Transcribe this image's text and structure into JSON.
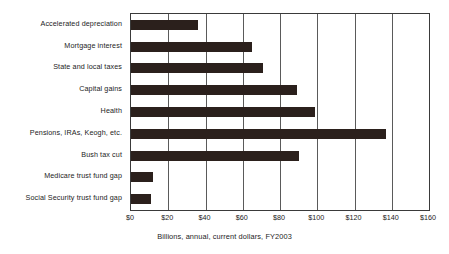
{
  "chart_data": {
    "type": "bar",
    "orientation": "horizontal",
    "title": "",
    "xlabel": "Billions, annual, current dollars, FY2003",
    "ylabel": "",
    "categories": [
      "Accelerated depreciation",
      "Mortgage interest",
      "State and local taxes",
      "Capital gains",
      "Health",
      "Pensions, IRAs, Keogh, etc.",
      "Bush tax cut",
      "Medicare trust fund gap",
      "Social Security trust fund gap"
    ],
    "values": [
      36,
      65,
      71,
      89,
      99,
      137,
      90,
      12,
      11
    ],
    "xlim": [
      0,
      160
    ],
    "xticks": [
      0,
      20,
      40,
      60,
      80,
      100,
      120,
      140,
      160
    ],
    "xtick_labels": [
      "$0",
      "$20",
      "$40",
      "$60",
      "$80",
      "$100",
      "$120",
      "$140",
      "$160"
    ],
    "grid": "vertical",
    "legend": "none",
    "bar_color": "#2b201c",
    "axis_color": "#3a3a3a",
    "gridline_color": "#5a5a5a",
    "background_color": "#ffffff"
  },
  "caption": "Billions, annual, current dollars, FY2003"
}
